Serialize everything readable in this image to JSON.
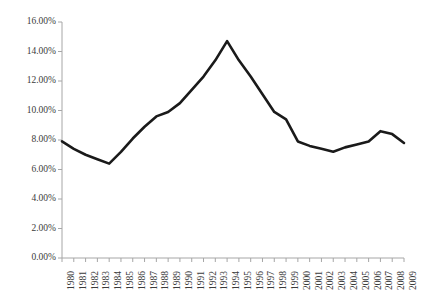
{
  "chart_data": {
    "type": "line",
    "title": "",
    "subtitle": "",
    "xlabel": "",
    "ylabel": "",
    "grid": false,
    "legend": false,
    "legend_position": "none",
    "ylim": [
      0,
      16
    ],
    "yticks": [
      0,
      2,
      4,
      6,
      8,
      10,
      12,
      14,
      16
    ],
    "ytick_labels": [
      "0.00%",
      "2.00%",
      "4.00%",
      "6.00%",
      "8.00%",
      "10.00%",
      "12.00%",
      "14.00%",
      "16.00%"
    ],
    "categories": [
      "1980",
      "1981",
      "1982",
      "1983",
      "1984",
      "1985",
      "1986",
      "1987",
      "1988",
      "1989",
      "1990",
      "1991",
      "1992",
      "1993",
      "1994",
      "1995",
      "1996",
      "1997",
      "1998",
      "1999",
      "2000",
      "2001",
      "2002",
      "2003",
      "2004",
      "2005",
      "2006",
      "2007",
      "2008",
      "2009"
    ],
    "values": [
      7.9,
      7.4,
      7.0,
      6.7,
      6.4,
      7.2,
      8.1,
      8.9,
      9.6,
      9.9,
      10.5,
      11.4,
      12.3,
      13.4,
      14.7,
      13.4,
      12.3,
      11.1,
      9.9,
      9.4,
      7.9,
      7.6,
      7.4,
      7.2,
      7.5,
      7.7,
      7.9,
      8.6,
      8.4,
      7.8
    ],
    "series_name": "",
    "line_color": "#1a1a1a",
    "line_width": 2.6,
    "axis_color": "#a6a6a6",
    "tick_label_color": "#3b3b3b",
    "background_color": "#ffffff",
    "units": "percent"
  },
  "layout": {
    "plot_left": 62,
    "plot_right": 404,
    "plot_top": 22,
    "plot_bottom": 258
  }
}
